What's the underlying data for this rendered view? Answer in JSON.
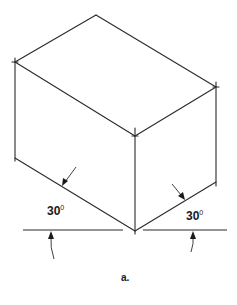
{
  "figure": {
    "caption": "a.",
    "type": "isometric box drawing",
    "vertices": {
      "top": [
        96,
        15
      ],
      "left": [
        15,
        62
      ],
      "center_top": [
        135,
        136
      ],
      "right": [
        216,
        87
      ],
      "bottom_left": [
        15,
        158
      ],
      "bottom_center": [
        135,
        231
      ],
      "bottom_right": [
        216,
        182
      ]
    },
    "angles": [
      {
        "id": "left",
        "value": "30",
        "unit_symbol": "0"
      },
      {
        "id": "right",
        "value": "30",
        "unit_symbol": "0"
      }
    ]
  }
}
